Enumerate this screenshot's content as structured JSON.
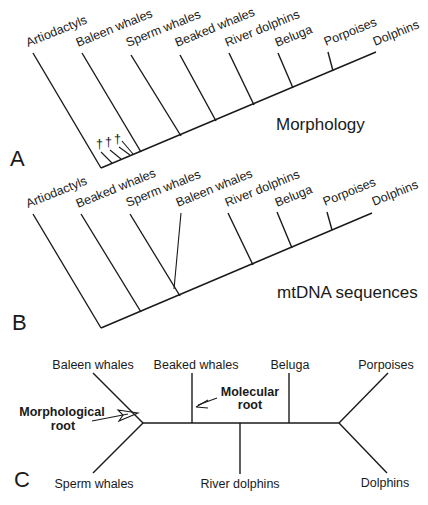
{
  "panels": {
    "A": {
      "label": "A",
      "caption": "Morphology",
      "taxa": [
        "Artiodactyls",
        "Baleen whales",
        "Sperm whales",
        "Beaked whales",
        "River dolphins",
        "Beluga",
        "Porpoises",
        "Dolphins"
      ],
      "fossil_marker": "†",
      "fossil_count": 3
    },
    "B": {
      "label": "B",
      "caption": "mtDNA sequences",
      "taxa": [
        "Artiodactyls",
        "Beaked whales",
        "Sperm whales",
        "Baleen whales",
        "River dolphins",
        "Beluga",
        "Porpoises",
        "Dolphins"
      ]
    },
    "C": {
      "label": "C",
      "taxa": {
        "baleen": "Baleen whales",
        "sperm": "Sperm whales",
        "beaked": "Beaked whales",
        "river": "River dolphins",
        "beluga": "Beluga",
        "porpoises": "Porpoises",
        "dolphins": "Dolphins"
      },
      "morph_root_line1": "Morphological",
      "morph_root_line2": "root",
      "mol_root_line1": "Molecular",
      "mol_root_line2": "root"
    }
  }
}
